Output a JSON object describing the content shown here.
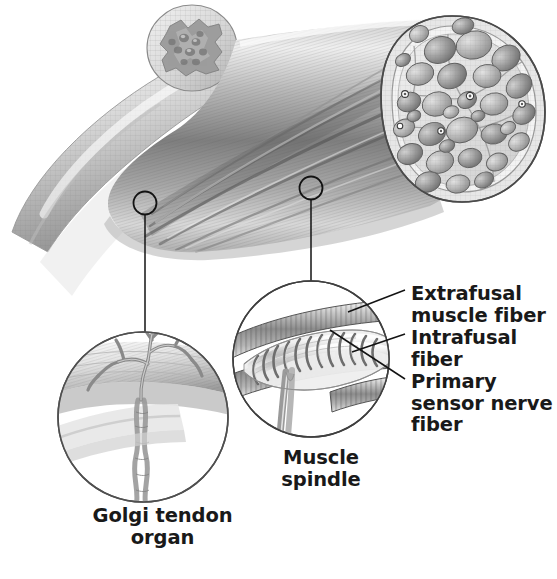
{
  "figure": {
    "background_color": "#ffffff",
    "text_color": "#191919",
    "line_color": "#1a1a1a",
    "style": "grayscale pencil-shaded anatomical illustration"
  },
  "labels": {
    "extrafusal": "Extrafusal\nmuscle fiber",
    "intrafusal": "Intrafusal\nfiber",
    "primary_sensor": "Primary\nsensor nerve\nfiber",
    "muscle_spindle": "Muscle\nspindle",
    "golgi_tendon_organ": "Golgi tendon\norgan"
  },
  "structures": {
    "tendon": "tendon",
    "muscle_belly": "muscle belly with longitudinal striations",
    "muscle_cross_section": "muscle cross-section showing fascicles",
    "tendon_cross_section_inset": "tendon cross-section inset",
    "spindle_detail_circle": "muscle spindle detail magnifier",
    "golgi_detail_circle": "golgi tendon organ detail magnifier"
  },
  "callouts": {
    "golgi_marker": "callout marker on tendon-muscle junction",
    "spindle_marker": "callout marker on muscle belly"
  },
  "colors": {
    "ink": "#1a1a1a",
    "mid_gray": "#8c8c8c",
    "light_gray": "#d8d8d8",
    "pale": "#efefef",
    "deep_gray": "#5a5a5a"
  }
}
